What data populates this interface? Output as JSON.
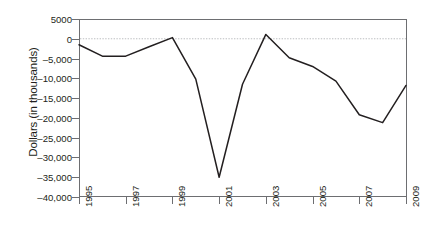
{
  "chart_data": {
    "type": "line",
    "title": "",
    "subtitle": "",
    "xlabel": "",
    "ylabel": "Dollars (in thousands)",
    "x": [
      1995,
      1996,
      1997,
      1998,
      1999,
      2000,
      2001,
      2002,
      2003,
      2004,
      2005,
      2006,
      2007,
      2008,
      2009
    ],
    "values": [
      -1500,
      -4400,
      -4400,
      -2000,
      300,
      -10200,
      -35000,
      -11500,
      1100,
      -4800,
      -7000,
      -10700,
      -19200,
      -21200,
      -11800
    ],
    "series": [
      {
        "name": "Dollars (in thousands)",
        "values": [
          -1500,
          -4400,
          -4400,
          -2000,
          300,
          -10200,
          -35000,
          -11500,
          1100,
          -4800,
          -7000,
          -10700,
          -19200,
          -21200,
          -11800
        ]
      }
    ],
    "xlim": [
      1995,
      2009
    ],
    "ylim": [
      -40000,
      5000
    ],
    "x_tick_values": [
      1995,
      1997,
      1999,
      2001,
      2003,
      2005,
      2007,
      2009
    ],
    "x_tick_labels": [
      "1995",
      "1997",
      "1999",
      "2001",
      "2003",
      "2005",
      "2007",
      "2009"
    ],
    "y_tick_values": [
      5000,
      0,
      -5000,
      -10000,
      -15000,
      -20000,
      -25000,
      -30000,
      -35000,
      -40000
    ],
    "y_tick_labels": [
      "5000",
      "0",
      "–5,000",
      "–10,000",
      "–15,000",
      "–20,000",
      "–25,000",
      "–30,000",
      "–35,000",
      "–40,000"
    ],
    "grid": false,
    "zero_reference_line": true,
    "legend": false,
    "legend_position": "none",
    "line_color": "#231f20",
    "zero_line_color": "#bcbec0",
    "axis_color": "#6d6e71",
    "background_color": "#ffffff"
  }
}
